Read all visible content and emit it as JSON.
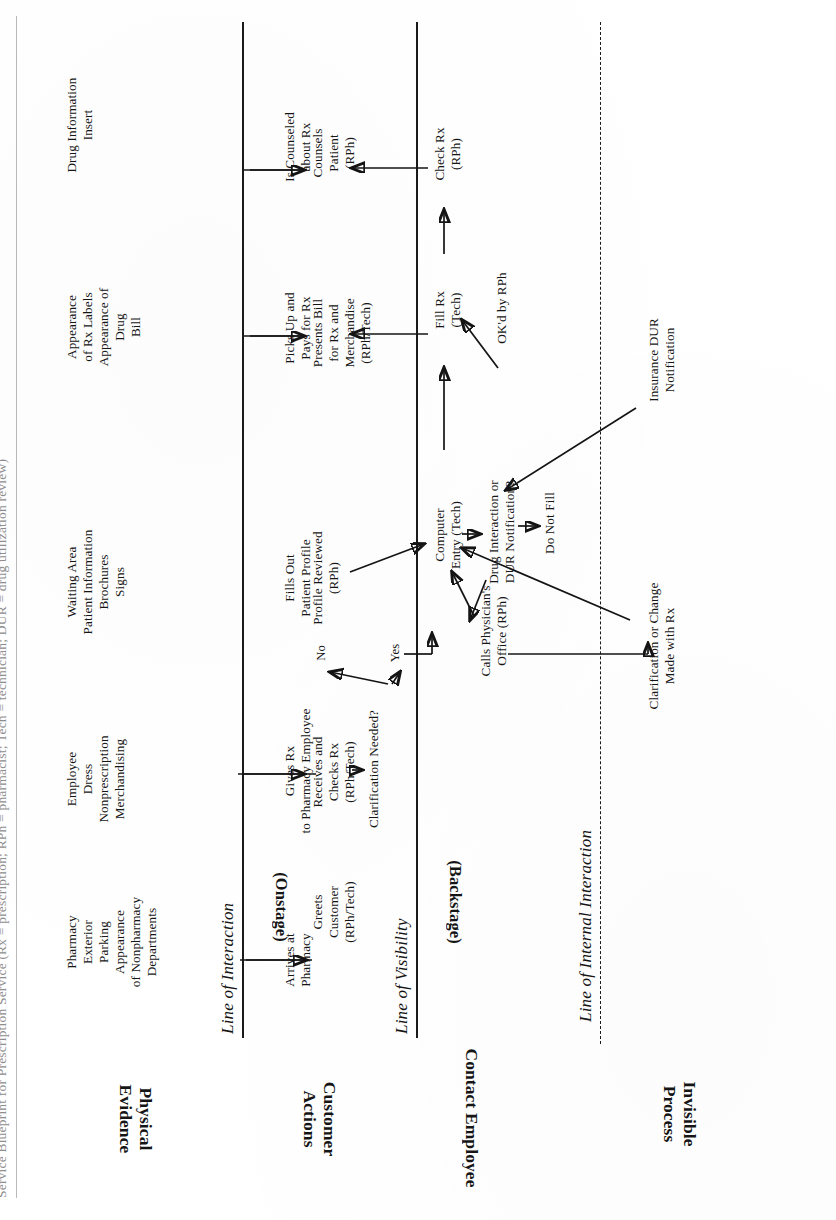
{
  "sheet": {
    "title": "Service Blueprint for Prescription Service (Rx = prescription; RPh = pharmacist; Tech = technician; DUR = drug utilization review)"
  },
  "rows": [
    {
      "id": "physical-evidence",
      "label": "Physical\nEvidence"
    },
    {
      "id": "customer-actions",
      "label": "Customer\nActions"
    },
    {
      "id": "contact-employee",
      "label": "Contact Employee",
      "sub": "(Onstage)"
    },
    {
      "id": "contact-employee-backstage",
      "label": "",
      "sub": "(Backstage)"
    },
    {
      "id": "invisible-process",
      "label": "Invisible\nProcess"
    }
  ],
  "lines": [
    {
      "id": "line-of-interaction",
      "label": "Line of Interaction",
      "style": "solid"
    },
    {
      "id": "line-of-visibility",
      "label": "Line of Visibility",
      "style": "solid"
    },
    {
      "id": "line-of-internal-interaction",
      "label": "Line of Internal Interaction",
      "style": "dashed"
    }
  ],
  "physical_evidence": [
    {
      "id": "pe-1",
      "text": "Pharmacy\nExterior\nParking\nAppearance\nof Nonpharmacy\nDepartments"
    },
    {
      "id": "pe-2",
      "text": "Employee\nDress\nNonprescription\nMerchandising"
    },
    {
      "id": "pe-3",
      "text": "Waiting Area\nPatient Information\nBrochures\nSigns"
    },
    {
      "id": "pe-4",
      "text": "Appearance\nof Rx Labels\nAppearance of\nDrug\nBill"
    },
    {
      "id": "pe-5",
      "text": "Drug Information\nInsert"
    }
  ],
  "customer_actions": [
    {
      "id": "ca-arrives",
      "text": "Arrives at\nPharmacy"
    },
    {
      "id": "ca-gives-rx",
      "text": "Gives Rx\nto Pharmacy Employee"
    },
    {
      "id": "ca-fills-out",
      "text": "Fills Out\nPatient Profile"
    },
    {
      "id": "ca-picks-up",
      "text": "Picks Up and\nPays for Rx"
    },
    {
      "id": "ca-counseled",
      "text": "Is Counseled\nabout Rx"
    }
  ],
  "onstage": [
    {
      "id": "on-greets",
      "text": "Greets\nCustomer\n(RPh/Tech)"
    },
    {
      "id": "on-receives",
      "text": "Receives and\nChecks Rx\n(RPh/Tech)"
    },
    {
      "id": "on-clarif",
      "text": "Clarification Needed?"
    },
    {
      "id": "on-yes",
      "text": "Yes"
    },
    {
      "id": "on-no",
      "text": "No"
    },
    {
      "id": "on-profile",
      "text": "Profile Reviewed\n(RPh)"
    },
    {
      "id": "on-presents",
      "text": "Presents Bill\nfor Rx and\nMerchandise\n(RPh/Tech)"
    },
    {
      "id": "on-counsels",
      "text": "Counsels\nPatient\n(RPh)"
    }
  ],
  "backstage": [
    {
      "id": "bs-calls",
      "text": "Calls Physician's\nOffice (RPh)"
    },
    {
      "id": "bs-computer",
      "text": "Computer\nEntry (Tech)"
    },
    {
      "id": "bs-drug-int",
      "text": "Drug Interaction or\nDUR Notification?"
    },
    {
      "id": "bs-do-not",
      "text": "Do Not Fill"
    },
    {
      "id": "bs-fill",
      "text": "Fill Rx\n(Tech)"
    },
    {
      "id": "bs-okd",
      "text": "OK'd by RPh"
    },
    {
      "id": "bs-check",
      "text": "Check Rx\n(RPh)"
    }
  ],
  "invisible_process": [
    {
      "id": "ip-clarif",
      "text": "Clarification or Change\nMade with Rx"
    },
    {
      "id": "ip-insurance",
      "text": "Insurance DUR\nNotification"
    }
  ],
  "colors": {
    "ink": "#141414",
    "paper": "#ffffff",
    "faint_rule": "#b9b9b9"
  }
}
